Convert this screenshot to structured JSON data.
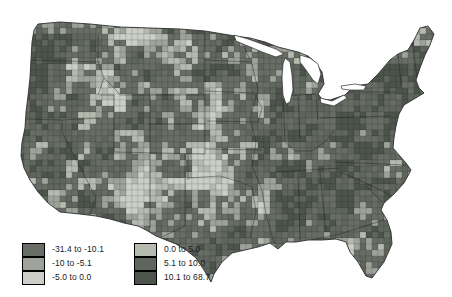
{
  "legend": {
    "items": [
      {
        "label": "-31.4 to -10.1",
        "color": "#686d66"
      },
      {
        "label": "-10 to -5.1",
        "color": "#9da29a"
      },
      {
        "label": "-5.0 to 0.0",
        "color": "#cbcfc7"
      },
      {
        "label": "0.0 to 5.0",
        "color": "#b6bbb0"
      },
      {
        "label": "5.1 to 10.0",
        "color": "#5f665d"
      },
      {
        "label": "10.1 to 68.7",
        "color": "#4c544b"
      }
    ]
  },
  "map": {
    "background": "#ffffff",
    "outline_color": "#2e2e2e",
    "state_line_color": "#1c1c1c",
    "county_line_color": "rgba(25,25,25,0.3)",
    "lake_fill": "#ffffff"
  }
}
